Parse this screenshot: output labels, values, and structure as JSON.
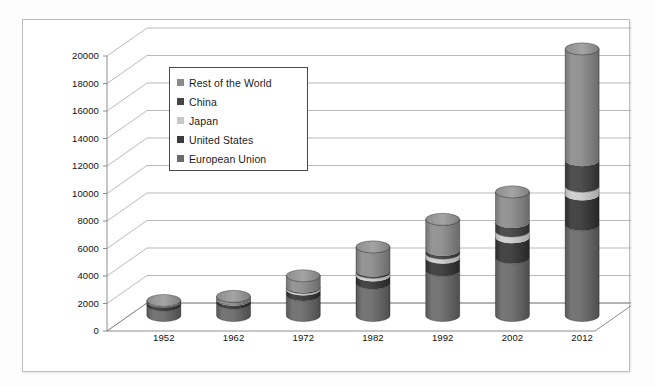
{
  "chart_data": {
    "type": "bar",
    "subtype": "stacked-3d-cylinder",
    "title": "",
    "subtitle": "",
    "xlabel": "",
    "ylabel": "",
    "ylim": [
      0,
      20000
    ],
    "ytick_step": 2000,
    "grid": true,
    "legend_position": "upper-left-inside",
    "stack_order_bottom_to_top": [
      "European Union",
      "United States",
      "Japan",
      "China",
      "Rest of the World"
    ],
    "categories": [
      "1952",
      "1962",
      "1972",
      "1982",
      "1992",
      "2002",
      "2012"
    ],
    "yticks": [
      "0",
      "2000",
      "4000",
      "6000",
      "8000",
      "10000",
      "12000",
      "14000",
      "16000",
      "18000",
      "20000"
    ],
    "series": [
      {
        "name": "European Union",
        "color": "#6b6b6b",
        "values": [
          760,
          900,
          1500,
          2350,
          3300,
          4200,
          6600
        ]
      },
      {
        "name": "United States",
        "color": "#3a3a3a",
        "values": [
          230,
          260,
          400,
          560,
          900,
          1500,
          2200
        ]
      },
      {
        "name": "Japan",
        "color": "#c8c8c8",
        "values": [
          20,
          40,
          130,
          230,
          330,
          450,
          600
        ]
      },
      {
        "name": "China",
        "color": "#454545",
        "values": [
          10,
          20,
          60,
          130,
          240,
          650,
          1900
        ]
      },
      {
        "name": "Rest of the World",
        "color": "#8a8a8a",
        "values": [
          80,
          180,
          810,
          1730,
          2230,
          2200,
          8100
        ]
      }
    ],
    "totals": [
      1100,
      1400,
      2900,
      5000,
      7000,
      9000,
      19400
    ]
  },
  "legend": {
    "items": [
      {
        "label": "Rest of the World",
        "color": "#8a8a8a"
      },
      {
        "label": "China",
        "color": "#454545"
      },
      {
        "label": "Japan",
        "color": "#c8c8c8"
      },
      {
        "label": "United States",
        "color": "#3a3a3a"
      },
      {
        "label": "European Union",
        "color": "#6b6b6b"
      }
    ]
  },
  "colors": {
    "frame_border": "#bdbdbd",
    "gridline": "#9a9a9a",
    "axis": "#8c8c8c",
    "text": "#111111",
    "background": "#ffffff"
  }
}
